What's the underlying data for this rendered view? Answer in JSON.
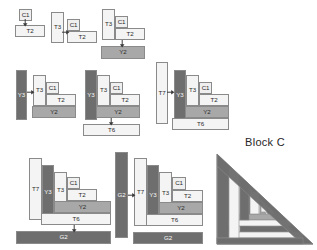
{
  "title": "Block C",
  "colors": {
    "light": "#efefef",
    "lighter": "#f4f4f4",
    "medium": "#a8a8a8",
    "dark": "#6e6e6e",
    "stroke": "#8a8a8a",
    "text": "#2b2b2b",
    "background": "#ffffff"
  },
  "piece_labels": {
    "c1": "C1",
    "t2": "T2",
    "t3": "T3",
    "y2": "Y2",
    "y3": "Y3",
    "t6": "T6",
    "t7": "T7",
    "g2": "G2"
  },
  "steps": [
    {
      "id": "step-1",
      "name": "step-1-c1-t2",
      "pieces": [
        {
          "label": "C1",
          "tone": "light"
        },
        {
          "label": "T2",
          "tone": "lighter"
        }
      ]
    },
    {
      "id": "step-2",
      "name": "step-2-add-t3",
      "pieces": [
        {
          "label": "T3",
          "tone": "lighter"
        },
        {
          "label": "C1",
          "tone": "light"
        },
        {
          "label": "T2",
          "tone": "lighter"
        }
      ]
    },
    {
      "id": "step-3",
      "name": "step-3-add-y2",
      "pieces": [
        {
          "label": "T3",
          "tone": "lighter"
        },
        {
          "label": "C1",
          "tone": "light"
        },
        {
          "label": "T2",
          "tone": "lighter"
        },
        {
          "label": "Y2",
          "tone": "medium"
        }
      ]
    },
    {
      "id": "step-4",
      "name": "step-4-add-y3",
      "pieces": [
        {
          "label": "Y3",
          "tone": "dark"
        },
        {
          "label": "T3",
          "tone": "lighter"
        },
        {
          "label": "C1",
          "tone": "light"
        },
        {
          "label": "T2",
          "tone": "lighter"
        },
        {
          "label": "Y2",
          "tone": "medium"
        }
      ]
    },
    {
      "id": "step-5",
      "name": "step-5-add-t6",
      "pieces": [
        {
          "label": "Y3",
          "tone": "dark"
        },
        {
          "label": "T3",
          "tone": "lighter"
        },
        {
          "label": "C1",
          "tone": "light"
        },
        {
          "label": "T2",
          "tone": "lighter"
        },
        {
          "label": "Y2",
          "tone": "medium"
        },
        {
          "label": "T6",
          "tone": "lighter"
        }
      ]
    },
    {
      "id": "step-6",
      "name": "step-6-add-t7",
      "pieces": [
        {
          "label": "T7",
          "tone": "lighter"
        },
        {
          "label": "Y3",
          "tone": "dark"
        },
        {
          "label": "T3",
          "tone": "lighter"
        },
        {
          "label": "C1",
          "tone": "light"
        },
        {
          "label": "T2",
          "tone": "lighter"
        },
        {
          "label": "Y2",
          "tone": "medium"
        },
        {
          "label": "T6",
          "tone": "lighter"
        }
      ]
    },
    {
      "id": "step-7",
      "name": "step-7-add-g2",
      "pieces": [
        {
          "label": "T7",
          "tone": "lighter"
        },
        {
          "label": "Y3",
          "tone": "dark"
        },
        {
          "label": "T3",
          "tone": "lighter"
        },
        {
          "label": "C1",
          "tone": "light"
        },
        {
          "label": "T2",
          "tone": "lighter"
        },
        {
          "label": "Y2",
          "tone": "medium"
        },
        {
          "label": "T6",
          "tone": "lighter"
        },
        {
          "label": "G2",
          "tone": "dark"
        }
      ]
    },
    {
      "id": "step-8",
      "name": "step-8-attach-g2-side",
      "pieces": [
        {
          "label": "G2",
          "tone": "dark"
        },
        {
          "label": "T7",
          "tone": "lighter"
        },
        {
          "label": "Y3",
          "tone": "dark"
        },
        {
          "label": "T3",
          "tone": "lighter"
        },
        {
          "label": "C1",
          "tone": "light"
        },
        {
          "label": "T2",
          "tone": "lighter"
        },
        {
          "label": "Y2",
          "tone": "medium"
        },
        {
          "label": "T6",
          "tone": "lighter"
        },
        {
          "label": "G2",
          "tone": "dark"
        }
      ]
    },
    {
      "id": "step-9",
      "name": "step-9-finished-triangle",
      "pieces": []
    }
  ],
  "s1": {
    "c1": "C1",
    "t2": "T2"
  },
  "s2": {
    "t3": "T3",
    "c1": "C1",
    "t2": "T2"
  },
  "s3": {
    "t3": "T3",
    "c1": "C1",
    "t2": "T2",
    "y2": "Y2"
  },
  "s4": {
    "y3": "Y3",
    "t3": "T3",
    "c1": "C1",
    "t2": "T2",
    "y2": "Y2"
  },
  "s5": {
    "y3": "Y3",
    "t3": "T3",
    "c1": "C1",
    "t2": "T2",
    "y2": "Y2",
    "t6": "T6"
  },
  "s6": {
    "t7": "T7",
    "y3": "Y3",
    "t3": "T3",
    "c1": "C1",
    "t2": "T2",
    "y2": "Y2",
    "t6": "T6"
  },
  "s7": {
    "t7": "T7",
    "y3": "Y3",
    "t3": "T3",
    "c1": "C1",
    "t2": "T2",
    "y2": "Y2",
    "t6": "T6",
    "g2": "G2"
  },
  "s8": {
    "g2a": "G2",
    "t7": "T7",
    "y3": "Y3",
    "t3": "T3",
    "c1": "C1",
    "t2": "T2",
    "y2": "Y2",
    "t6": "T6",
    "g2b": "G2"
  }
}
